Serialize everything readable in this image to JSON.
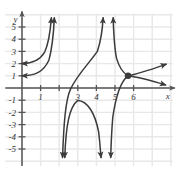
{
  "chart_data": {
    "type": "line",
    "title": "",
    "xlabel": "x",
    "ylabel": "y",
    "grid": true,
    "legend": false,
    "xlim": [
      -0.9,
      8.1
    ],
    "ylim": [
      -6.4,
      6.1
    ],
    "xticks": [
      1,
      2,
      3,
      4,
      5,
      6
    ],
    "xtick_labels": [
      "1",
      "",
      "3",
      "4",
      "5",
      "6"
    ],
    "yticks": [
      5,
      4,
      3,
      2,
      1,
      -1,
      -2,
      -3,
      -4,
      -5
    ],
    "ytick_labels": [
      "5",
      "4",
      "3",
      "2",
      "1",
      "-1",
      "-2",
      "-3",
      "-4",
      "-5"
    ],
    "axis_arrows": [
      "up",
      "right"
    ],
    "curve_color": "#3b3b3b",
    "grid_color": "#e8e8e8",
    "axis_color": "#7a7a7a",
    "points": [
      {
        "name": "junction-point",
        "x": 5.7,
        "y": 1.0,
        "filled": true
      }
    ],
    "series": [
      {
        "name": "upper-left-branch",
        "path": "M 0.0,2.0 C 0.55,2.02 0.95,2.25 1.22,2.95 C 1.42,3.6 1.52,4.6 1.58,5.75",
        "start_arrow": "left",
        "end_arrow": "up"
      },
      {
        "name": "lower-left-branch",
        "path": "M 0.0,1.0 C 0.7,1.02 1.15,1.3 1.45,2.3 C 1.62,3.25 1.70,4.55 1.74,5.75",
        "start_arrow": "left",
        "end_arrow": "up"
      },
      {
        "name": "s-curve-rising-branch",
        "path": "M 2.18,-5.7 C 2.24,-3.2 2.32,-1.0 2.62,-0.05 C 3.05,1.25 3.6,2.0 4.05,3.0 C 4.25,3.9 4.33,4.9 4.36,5.75",
        "start_arrow": "down",
        "end_arrow": "up"
      },
      {
        "name": "asymptote-right-up-branch",
        "path": "M 4.90,5.75 C 4.93,4.4 4.98,3.2 5.08,2.45 C 5.22,1.7 5.42,1.25 5.70,1.0",
        "start_arrow": "up",
        "end_arrow": "none"
      },
      {
        "name": "junction-upper-right-ray",
        "path": "M 5.70,1.0 C 6.25,1.15 6.9,1.5 7.75,1.95",
        "start_arrow": "none",
        "end_arrow": "right"
      },
      {
        "name": "junction-lower-right-ray",
        "path": "M 5.70,1.0 C 6.3,0.88 6.95,0.6 7.72,0.25",
        "start_arrow": "none",
        "end_arrow": "right"
      },
      {
        "name": "inverted-arch",
        "path": "M 2.30,-5.7 C 2.36,-3.0 2.55,-1.55 3.0,-1.02 C 3.5,-1.05 3.92,-2.0 4.12,-3.6 C 4.2,-4.6 4.22,-5.3 4.25,-5.7",
        "start_arrow": "down",
        "end_arrow": "down"
      },
      {
        "name": "asymptote-left-down-branch",
        "path": "M 5.70,1.0 C 5.35,0.6 5.05,-0.6 4.88,-2.4 C 4.80,-3.9 4.78,-5.1 4.77,-5.7",
        "start_arrow": "none",
        "end_arrow": "down"
      }
    ]
  }
}
